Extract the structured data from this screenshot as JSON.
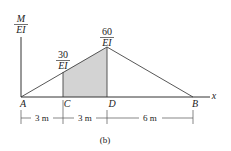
{
  "figure": {
    "caption": "(b)",
    "axis": {
      "y_label_num": "M",
      "y_label_den": "EI",
      "x_label": "x"
    },
    "points": {
      "A": "A",
      "C": "C",
      "D": "D",
      "B": "B"
    },
    "values": {
      "at_C_num": "30",
      "at_C_den": "EI",
      "at_D_num": "60",
      "at_D_den": "EI"
    },
    "dimensions": {
      "AC": "3 m",
      "CD": "3 m",
      "DB": "6 m"
    },
    "colors": {
      "line": "#333333",
      "shade": "#d3d3d3"
    }
  }
}
